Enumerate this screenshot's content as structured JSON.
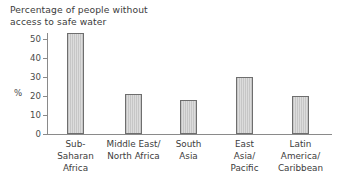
{
  "chart_data": {
    "type": "bar",
    "title": "Percentage of people without\naccess to safe water",
    "xlabel": "",
    "ylabel": "%",
    "ylim": [
      0,
      55
    ],
    "yticks": [
      0,
      10,
      20,
      30,
      40,
      50
    ],
    "grid": false,
    "legend": "none",
    "categories": [
      "Sub-\nSaharan\nAfrica",
      "Middle East/\nNorth Africa",
      "South\nAsia",
      "East\nAsia/\nPacific",
      "Latin\nAmerica/\nCaribbean"
    ],
    "values": [
      53,
      21,
      18,
      30,
      20
    ],
    "bar_color": "#cfcfcf",
    "bar_edge_color": "#6e6e6e",
    "axis_color": "#8a8a8a",
    "text_color": "#3c3c3c"
  },
  "axis": {
    "tick_labels": [
      "50",
      "40",
      "30",
      "20",
      "10",
      "0"
    ],
    "unit": "%"
  }
}
